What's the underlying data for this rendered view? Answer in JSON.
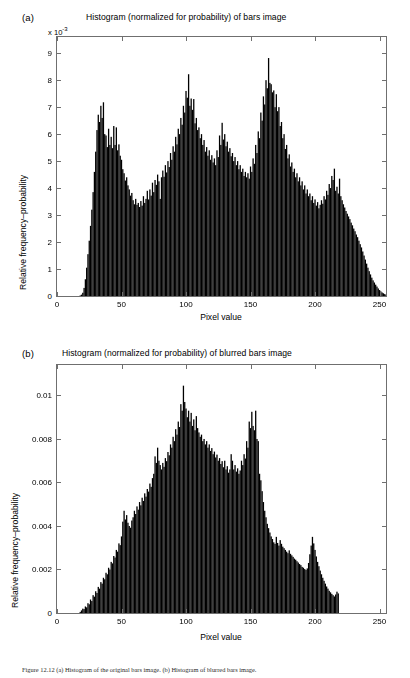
{
  "figure": {
    "caption": "Figure 12.12   (a) Histogram of the original bars image.  (b) Histogram of blurred bars image."
  },
  "panels": [
    {
      "tag": "(a)",
      "title": "Histogram (normalized for probability) of bars image",
      "exponent_label": "x 10",
      "exponent_sup": "-3",
      "xlabel": "Pixel value",
      "ylabel": "Relative frequency–probability",
      "xticks": [
        "0",
        "50",
        "100",
        "150",
        "200",
        "250"
      ],
      "yticks": [
        "0",
        "1",
        "2",
        "3",
        "4",
        "5",
        "6",
        "7",
        "8",
        "9"
      ]
    },
    {
      "tag": "(b)",
      "title": "Histogram (normalized for probability) of blurred bars image",
      "exponent_label": "",
      "exponent_sup": "",
      "xlabel": "Pixel value",
      "ylabel": "Relative frequency–probability",
      "xticks": [
        "0",
        "50",
        "100",
        "150",
        "200",
        "250"
      ],
      "yticks": [
        "0",
        "0.002",
        "0.004",
        "0.006",
        "0.008",
        "0.01"
      ]
    }
  ],
  "chart_data": [
    {
      "type": "bar",
      "title": "Histogram (normalized for probability) of bars image",
      "xlabel": "Pixel value",
      "ylabel": "Relative frequency–probability",
      "y_multiplier": 0.001,
      "y_multiplier_label": "x 10^-3",
      "xlim": [
        0,
        255
      ],
      "ylim": [
        0,
        9.6
      ],
      "xticks": [
        0,
        50,
        100,
        150,
        200,
        250
      ],
      "yticks": [
        0,
        1,
        2,
        3,
        4,
        5,
        6,
        7,
        8,
        9
      ],
      "grid": false,
      "legend": null,
      "bar_color": "#000000",
      "x": [
        0,
        1,
        2,
        3,
        4,
        5,
        6,
        7,
        8,
        9,
        10,
        11,
        12,
        13,
        14,
        15,
        16,
        17,
        18,
        19,
        20,
        21,
        22,
        23,
        24,
        25,
        26,
        27,
        28,
        29,
        30,
        31,
        32,
        33,
        34,
        35,
        36,
        37,
        38,
        39,
        40,
        41,
        42,
        43,
        44,
        45,
        46,
        47,
        48,
        49,
        50,
        51,
        52,
        53,
        54,
        55,
        56,
        57,
        58,
        59,
        60,
        61,
        62,
        63,
        64,
        65,
        66,
        67,
        68,
        69,
        70,
        71,
        72,
        73,
        74,
        75,
        76,
        77,
        78,
        79,
        80,
        81,
        82,
        83,
        84,
        85,
        86,
        87,
        88,
        89,
        90,
        91,
        92,
        93,
        94,
        95,
        96,
        97,
        98,
        99,
        100,
        101,
        102,
        103,
        104,
        105,
        106,
        107,
        108,
        109,
        110,
        111,
        112,
        113,
        114,
        115,
        116,
        117,
        118,
        119,
        120,
        121,
        122,
        123,
        124,
        125,
        126,
        127,
        128,
        129,
        130,
        131,
        132,
        133,
        134,
        135,
        136,
        137,
        138,
        139,
        140,
        141,
        142,
        143,
        144,
        145,
        146,
        147,
        148,
        149,
        150,
        151,
        152,
        153,
        154,
        155,
        156,
        157,
        158,
        159,
        160,
        161,
        162,
        163,
        164,
        165,
        166,
        167,
        168,
        169,
        170,
        171,
        172,
        173,
        174,
        175,
        176,
        177,
        178,
        179,
        180,
        181,
        182,
        183,
        184,
        185,
        186,
        187,
        188,
        189,
        190,
        191,
        192,
        193,
        194,
        195,
        196,
        197,
        198,
        199,
        200,
        201,
        202,
        203,
        204,
        205,
        206,
        207,
        208,
        209,
        210,
        211,
        212,
        213,
        214,
        215,
        216,
        217,
        218,
        219,
        220,
        221,
        222,
        223,
        224,
        225,
        226,
        227,
        228,
        229,
        230,
        231,
        232,
        233,
        234,
        235,
        236,
        237,
        238,
        239,
        240,
        241,
        242,
        243,
        244,
        245,
        246,
        247,
        248,
        249,
        250,
        251,
        252,
        253,
        254,
        255
      ],
      "values": [
        0,
        0,
        0,
        0,
        0,
        0,
        0,
        0,
        0,
        0,
        0,
        0,
        0,
        0,
        0,
        0,
        0,
        0,
        0.02,
        0.05,
        0.12,
        0.3,
        0.62,
        1.05,
        1.55,
        2.05,
        2.6,
        3.2,
        3.85,
        4.6,
        5.35,
        6.15,
        6.72,
        6.45,
        7.05,
        6.6,
        7.18,
        6.0,
        5.95,
        5.52,
        6.2,
        5.6,
        5.9,
        5.48,
        6.3,
        5.6,
        6.25,
        5.4,
        5.62,
        5.2,
        5.05,
        4.7,
        4.55,
        4.28,
        4.4,
        4.1,
        3.95,
        3.72,
        3.82,
        3.55,
        3.4,
        3.6,
        3.38,
        3.45,
        3.3,
        3.52,
        3.35,
        3.7,
        3.45,
        3.6,
        3.9,
        3.58,
        3.95,
        3.72,
        4.2,
        3.85,
        4.3,
        4.12,
        4.5,
        4.25,
        3.6,
        4.4,
        4.65,
        4.42,
        4.85,
        4.58,
        5.0,
        4.78,
        5.3,
        5.05,
        5.55,
        5.35,
        5.9,
        5.62,
        6.2,
        6.0,
        6.6,
        6.35,
        7.05,
        6.8,
        7.6,
        7.35,
        8.22,
        7.05,
        7.32,
        6.9,
        7.3,
        6.4,
        6.6,
        6.15,
        6.25,
        5.85,
        6.0,
        5.6,
        5.78,
        5.35,
        5.52,
        5.2,
        5.4,
        5.05,
        5.22,
        4.95,
        5.1,
        4.85,
        5.4,
        5.15,
        5.95,
        5.6,
        6.42,
        5.8,
        6.0,
        5.55,
        5.72,
        5.35,
        5.48,
        5.18,
        5.3,
        5.0,
        5.15,
        4.85,
        5.0,
        4.7,
        4.85,
        4.6,
        4.72,
        4.45,
        4.6,
        4.4,
        4.55,
        4.35,
        4.8,
        4.6,
        5.1,
        4.9,
        5.6,
        5.3,
        6.1,
        5.85,
        6.8,
        6.5,
        7.4,
        7.1,
        8.0,
        7.7,
        8.82,
        7.9,
        7.85,
        7.55,
        7.62,
        7.0,
        7.48,
        6.85,
        7.0,
        6.3,
        6.45,
        5.85,
        6.0,
        5.45,
        5.6,
        5.1,
        5.25,
        4.8,
        4.95,
        4.6,
        4.72,
        4.4,
        4.55,
        4.25,
        4.4,
        4.1,
        4.25,
        3.95,
        4.1,
        3.8,
        3.95,
        3.7,
        3.8,
        3.55,
        3.7,
        3.45,
        3.58,
        3.35,
        3.48,
        3.25,
        3.38,
        3.55,
        3.42,
        3.7,
        3.58,
        3.9,
        3.75,
        4.15,
        4.0,
        4.45,
        4.3,
        4.72,
        3.9,
        4.05,
        3.8,
        4.35,
        3.7,
        3.55,
        3.4,
        3.28,
        3.15,
        3.05,
        2.95,
        2.85,
        2.72,
        2.62,
        2.5,
        2.4,
        2.28,
        2.18,
        2.05,
        1.92,
        1.8,
        1.65,
        1.5,
        1.35,
        1.2,
        1.05,
        0.92,
        0.8,
        0.68,
        0.58,
        0.5,
        0.42,
        0.35,
        0.28,
        0.22,
        0.17,
        0.13,
        0.1,
        0.07,
        0.05,
        0.03,
        0.02,
        0.01,
        0,
        0,
        0,
        0,
        0,
        0,
        0,
        0,
        0,
        0,
        0,
        0,
        0,
        0,
        0,
        0
      ]
    },
    {
      "type": "bar",
      "title": "Histogram (normalized for probability) of blurred bars image",
      "xlabel": "Pixel value",
      "ylabel": "Relative frequency–probability",
      "y_multiplier": 1,
      "y_multiplier_label": "",
      "xlim": [
        0,
        255
      ],
      "ylim": [
        0,
        0.0114
      ],
      "xticks": [
        0,
        50,
        100,
        150,
        200,
        250
      ],
      "yticks": [
        0,
        0.002,
        0.004,
        0.006,
        0.008,
        0.01
      ],
      "grid": false,
      "legend": null,
      "bar_color": "#000000",
      "x": [
        0,
        1,
        2,
        3,
        4,
        5,
        6,
        7,
        8,
        9,
        10,
        11,
        12,
        13,
        14,
        15,
        16,
        17,
        18,
        19,
        20,
        21,
        22,
        23,
        24,
        25,
        26,
        27,
        28,
        29,
        30,
        31,
        32,
        33,
        34,
        35,
        36,
        37,
        38,
        39,
        40,
        41,
        42,
        43,
        44,
        45,
        46,
        47,
        48,
        49,
        50,
        51,
        52,
        53,
        54,
        55,
        56,
        57,
        58,
        59,
        60,
        61,
        62,
        63,
        64,
        65,
        66,
        67,
        68,
        69,
        70,
        71,
        72,
        73,
        74,
        75,
        76,
        77,
        78,
        79,
        80,
        81,
        82,
        83,
        84,
        85,
        86,
        87,
        88,
        89,
        90,
        91,
        92,
        93,
        94,
        95,
        96,
        97,
        98,
        99,
        100,
        101,
        102,
        103,
        104,
        105,
        106,
        107,
        108,
        109,
        110,
        111,
        112,
        113,
        114,
        115,
        116,
        117,
        118,
        119,
        120,
        121,
        122,
        123,
        124,
        125,
        126,
        127,
        128,
        129,
        130,
        131,
        132,
        133,
        134,
        135,
        136,
        137,
        138,
        139,
        140,
        141,
        142,
        143,
        144,
        145,
        146,
        147,
        148,
        149,
        150,
        151,
        152,
        153,
        154,
        155,
        156,
        157,
        158,
        159,
        160,
        161,
        162,
        163,
        164,
        165,
        166,
        167,
        168,
        169,
        170,
        171,
        172,
        173,
        174,
        175,
        176,
        177,
        178,
        179,
        180,
        181,
        182,
        183,
        184,
        185,
        186,
        187,
        188,
        189,
        190,
        191,
        192,
        193,
        194,
        195,
        196,
        197,
        198,
        199,
        200,
        201,
        202,
        203,
        204,
        205,
        206,
        207,
        208,
        209,
        210,
        211,
        212,
        213,
        214,
        215,
        216,
        217,
        218,
        219,
        220,
        221,
        222,
        223,
        224,
        225,
        226,
        227,
        228,
        229,
        230,
        231,
        232,
        233,
        234,
        235,
        236,
        237,
        238,
        239,
        240,
        241,
        242,
        243,
        244,
        245,
        246,
        247,
        248,
        249,
        250,
        251,
        252,
        253,
        254,
        255
      ],
      "values": [
        0,
        0,
        0,
        0,
        0,
        0,
        0,
        0,
        0,
        0,
        0,
        0,
        0,
        0,
        0,
        0,
        0,
        0,
        5e-05,
        0.00012,
        0.0002,
        0.00018,
        0.0003,
        0.00026,
        0.00045,
        0.0004,
        0.00062,
        0.00055,
        0.00082,
        0.00075,
        0.001,
        0.00092,
        0.0012,
        0.00112,
        0.00142,
        0.00135,
        0.00162,
        0.00155,
        0.00185,
        0.00178,
        0.00208,
        0.002,
        0.00235,
        0.00228,
        0.00262,
        0.00255,
        0.0029,
        0.00282,
        0.0032,
        0.00312,
        0.00352,
        0.0042,
        0.0047,
        0.0043,
        0.0045,
        0.00415,
        0.004,
        0.00392,
        0.00425,
        0.0044,
        0.0047,
        0.00455,
        0.0049,
        0.00475,
        0.0051,
        0.00495,
        0.0053,
        0.00515,
        0.0055,
        0.00535,
        0.0057,
        0.00558,
        0.00595,
        0.0058,
        0.0062,
        0.0064,
        0.0072,
        0.0069,
        0.0076,
        0.007,
        0.0068,
        0.0066,
        0.0069,
        0.00672,
        0.00712,
        0.00698,
        0.0074,
        0.00725,
        0.00775,
        0.0076,
        0.0081,
        0.0079,
        0.00845,
        0.0082,
        0.0088,
        0.00855,
        0.0096,
        0.0093,
        0.01045,
        0.0097,
        0.0094,
        0.009,
        0.0093,
        0.0088,
        0.0092,
        0.0086,
        0.0089,
        0.0084,
        0.00905,
        0.0085,
        0.0083,
        0.0081,
        0.0082,
        0.0079,
        0.008,
        0.00775,
        0.0079,
        0.0076,
        0.00775,
        0.00745,
        0.00758,
        0.0073,
        0.00742,
        0.00715,
        0.00728,
        0.007,
        0.00712,
        0.00685,
        0.00698,
        0.0067,
        0.007,
        0.0066,
        0.00675,
        0.00645,
        0.0066,
        0.0073,
        0.007,
        0.0066,
        0.0068,
        0.0065,
        0.00665,
        0.0064,
        0.00655,
        0.007,
        0.0068,
        0.0073,
        0.0071,
        0.0079,
        0.0076,
        0.0088,
        0.0085,
        0.00925,
        0.0086,
        0.0084,
        0.0093,
        0.008,
        0.0079,
        0.0064,
        0.0061,
        0.0056,
        0.0051,
        0.0047,
        0.0044,
        0.0041,
        0.0039,
        0.0037,
        0.00352,
        0.0034,
        0.00325,
        0.00318,
        0.0035,
        0.00322,
        0.0031,
        0.00335,
        0.00318,
        0.00305,
        0.00298,
        0.0029,
        0.00282,
        0.00275,
        0.00288,
        0.00272,
        0.00265,
        0.00258,
        0.0025,
        0.00245,
        0.00238,
        0.00232,
        0.00225,
        0.0022,
        0.00212,
        0.00208,
        0.00202,
        0.00198,
        0.00205,
        0.0023,
        0.0027,
        0.0031,
        0.0035,
        0.0032,
        0.0029,
        0.0026,
        0.00235,
        0.00215,
        0.00195,
        0.00178,
        0.00162,
        0.00148,
        0.00135,
        0.00122,
        0.00112,
        0.00102,
        0.00095,
        0.00088,
        0.00082,
        0.00076,
        0.00085,
        0.00098,
        0.0009,
        0,
        0,
        0,
        0,
        0,
        0,
        0,
        0,
        0,
        0,
        0,
        0,
        0,
        0,
        0,
        0,
        0,
        0,
        0,
        0,
        0,
        0,
        0,
        0,
        0,
        0,
        0,
        0,
        0,
        0,
        0,
        0,
        0,
        0,
        0,
        0
      ]
    }
  ]
}
